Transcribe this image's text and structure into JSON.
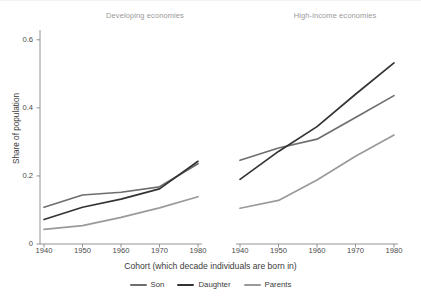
{
  "chart_data": {
    "type": "line",
    "title": "",
    "xlabel": "Cohort (which decade individuals are born in)",
    "ylabel": "Share of population",
    "x": [
      1940,
      1950,
      1960,
      1970,
      1980
    ],
    "xlim": [
      1936,
      1984
    ],
    "ylim": [
      0,
      0.62
    ],
    "yticks": [
      0,
      0.2,
      0.4,
      0.6
    ],
    "ytick_labels": [
      "0",
      "0.2",
      "0.4",
      "0.6"
    ],
    "xticks": [
      1940,
      1950,
      1960,
      1970,
      1980
    ],
    "xtick_labels": [
      "1940",
      "1950",
      "1960",
      "1970",
      "1980"
    ],
    "grid": false,
    "legend_position": "bottom",
    "panels": [
      {
        "name": "developing",
        "title": "Developing economies",
        "series": [
          {
            "name": "Son",
            "color": "#6e6e6e",
            "values": [
              0.108,
              0.144,
              0.152,
              0.168,
              0.236
            ]
          },
          {
            "name": "Daughter",
            "color": "#333333",
            "values": [
              0.072,
              0.108,
              0.132,
              0.162,
              0.243
            ]
          },
          {
            "name": "Parents",
            "color": "#9a9a9a",
            "values": [
              0.043,
              0.054,
              0.078,
              0.106,
              0.139
            ]
          }
        ]
      },
      {
        "name": "high-income",
        "title": "High-income economies",
        "series": [
          {
            "name": "Son",
            "color": "#6e6e6e",
            "values": [
              0.246,
              0.282,
              0.308,
              0.372,
              0.436
            ]
          },
          {
            "name": "Daughter",
            "color": "#333333",
            "values": [
              0.19,
              0.272,
              0.345,
              0.44,
              0.532
            ]
          },
          {
            "name": "Parents",
            "color": "#9a9a9a",
            "values": [
              0.105,
              0.128,
              0.188,
              0.258,
              0.32
            ]
          }
        ]
      }
    ],
    "legend": [
      {
        "label": "Son",
        "color": "#6e6e6e"
      },
      {
        "label": "Daughter",
        "color": "#333333"
      },
      {
        "label": "Parents",
        "color": "#9a9a9a"
      }
    ]
  },
  "axis": {
    "y_label": "Share of population",
    "x_label": "Cohort (which decade individuals are born in)",
    "y_ticks": [
      "0",
      "0.2",
      "0.4",
      "0.6"
    ],
    "x_ticks": [
      "1940",
      "1950",
      "1960",
      "1970",
      "1980"
    ]
  },
  "panels": {
    "left_title": "Developing economies",
    "right_title": "High-income economies"
  },
  "legend": {
    "son": "Son",
    "daughter": "Daughter",
    "parents": "Parents"
  },
  "colors": {
    "son": "#6e6e6e",
    "daughter": "#333333",
    "parents": "#9a9a9a",
    "axis": "#7a7a7a",
    "text": "#3b3b3b",
    "panel_title": "#9a9a9a",
    "background": "#ffffff"
  }
}
